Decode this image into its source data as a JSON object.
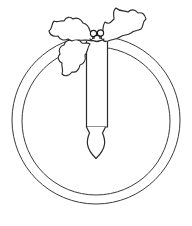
{
  "page": {
    "background_color": "#ffffff",
    "width": 192,
    "height": 226
  },
  "artwork": {
    "name": "christmas-wreath-with-holly-and-hanging-candle",
    "style": "black-and-white line drawing",
    "line_color": "#2b2b2b",
    "fill_color": "#ffffff",
    "elements": [
      {
        "name": "outer-wreath-ring",
        "shape": "circle",
        "cx": 96,
        "cy": 120,
        "r": 84,
        "stroke_color": "#3b3b3b"
      },
      {
        "name": "inner-wreath-ring",
        "shape": "circle",
        "cx": 96,
        "cy": 121,
        "r": 74,
        "stroke_color": "#3b3b3b"
      },
      {
        "name": "holly-leaf-left-upper",
        "shape": "spiky-holly-leaf",
        "stroke_color": "#2b2b2b"
      },
      {
        "name": "holly-leaf-left-lower",
        "shape": "spiky-holly-leaf",
        "stroke_color": "#2b2b2b"
      },
      {
        "name": "holly-leaf-right",
        "shape": "spiky-holly-leaf",
        "stroke_color": "#2b2b2b"
      },
      {
        "name": "holly-berry-cluster",
        "shape": "three-small-circles",
        "count": 3,
        "stroke_color": "#1d1d1d"
      },
      {
        "name": "hanging-candle-body",
        "shape": "vertical-rectangle",
        "stroke_color": "#2b2b2b"
      },
      {
        "name": "hanging-candle-tip",
        "shape": "pointed-teardrop-flame",
        "stroke_color": "#2b2b2b"
      }
    ]
  }
}
